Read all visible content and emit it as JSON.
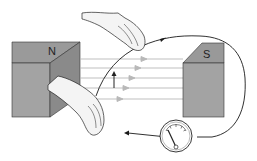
{
  "figure": {
    "magnets": [
      {
        "pole": "N",
        "side": "left"
      },
      {
        "pole": "S",
        "side": "right"
      }
    ],
    "field_lines": {
      "count": 5,
      "direction": "left-to-right"
    },
    "motion_arrow": {
      "direction": "up"
    },
    "meter": {
      "type": "galvanometer",
      "needle": "deflected-left"
    }
  },
  "colors": {
    "magnet_front": "#a3a3a3",
    "magnet_top": "#8f8f8f",
    "magnet_side": "#7d7d7d",
    "field_line": "#b5b5b5",
    "wire": "#1a1a1a",
    "hand_fill": "#f3f3f3",
    "background": "#ffffff"
  }
}
